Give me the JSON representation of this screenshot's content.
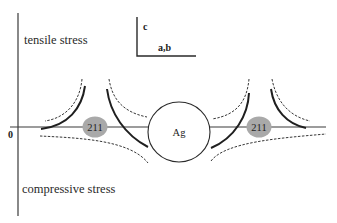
{
  "labels": {
    "tensile": "tensile stress",
    "compressive": "compressive stress",
    "zero": "0",
    "axis_c": "c",
    "axis_ab": "a,b"
  },
  "particles": {
    "center": "Ag",
    "left": "211",
    "right": "211"
  },
  "colors": {
    "line": "#2a2a2a",
    "particle_fill": "#a9a9a9",
    "ag_fill": "#ffffff"
  }
}
